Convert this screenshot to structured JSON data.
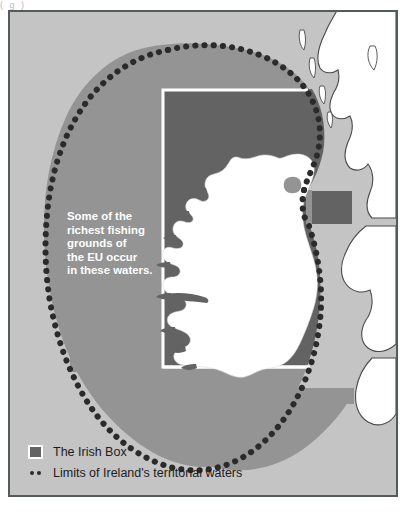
{
  "figure": {
    "top_fragment": "(    g      )",
    "caption_lines": [
      "Some of the",
      "richest fishing",
      "grounds of",
      "the EU occur",
      "in these waters."
    ]
  },
  "legend": {
    "items": [
      {
        "label": "The Irish Box",
        "symbol": "filled-square",
        "color": "#636363"
      },
      {
        "label": "Limits of Ireland's territorial waters",
        "symbol": "dotted-line",
        "color": "#2b2b2b"
      }
    ]
  },
  "colors": {
    "frame_border": "#555a5c",
    "open_sea": "#c4c4c4",
    "territorial_waters": "#949494",
    "irish_box": "#636363",
    "land": "#ffffff",
    "coastline": "#4a4a4a",
    "boundary_dots": "#2b2b2b",
    "box_outline": "#ffffff",
    "caption_text": "#ffffff",
    "legend_text": "#1c1c1c"
  },
  "map": {
    "title_region": "Ireland and surrounding waters",
    "features": [
      "Ireland",
      "Great Britain",
      "Lough Neagh",
      "Irish Box rectangle",
      "Irish territorial waters limit"
    ]
  }
}
